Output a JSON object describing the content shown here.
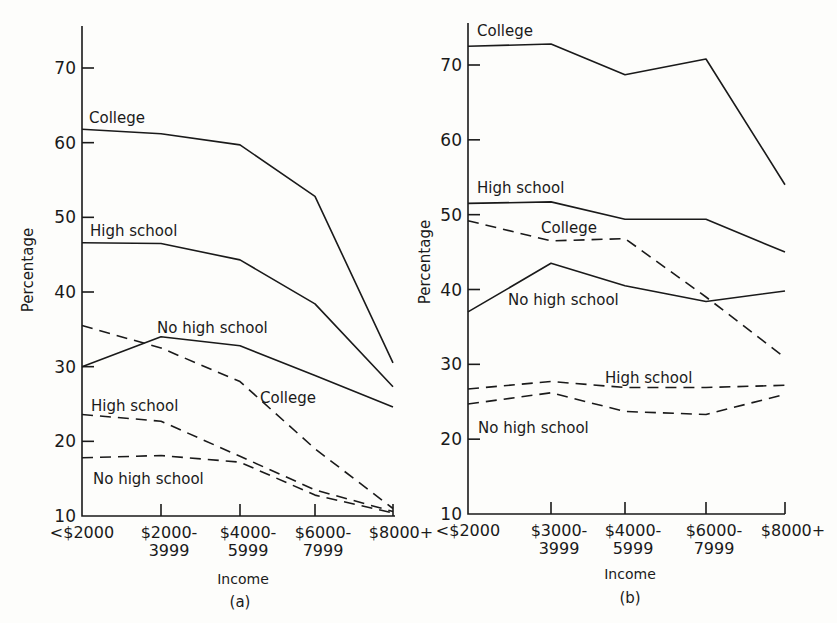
{
  "chart_data": [
    {
      "type": "line",
      "panel": "(a)",
      "title": "",
      "xlabel": "Income",
      "ylabel": "Percentage",
      "ylim": [
        10,
        75
      ],
      "yticks": [
        10,
        20,
        30,
        40,
        50,
        60,
        70
      ],
      "grid": false,
      "legend": "inline labels",
      "categories": [
        "<$2000",
        "$2000-3999",
        "$4000-5999",
        "$6000-7999",
        "$8000+"
      ],
      "category_lines": [
        [
          "<$2000",
          ""
        ],
        [
          "$2000-",
          "3999"
        ],
        [
          "$4000-",
          "5999"
        ],
        [
          "$6000-",
          "7999"
        ],
        [
          "$8000+",
          ""
        ]
      ],
      "series": [
        {
          "name": "College",
          "style": "solid",
          "label": "College",
          "values": [
            61.8,
            61.2,
            59.7,
            52.8,
            30.5
          ]
        },
        {
          "name": "High school",
          "style": "solid",
          "label": "High school",
          "values": [
            46.6,
            46.5,
            44.3,
            38.4,
            27.3
          ]
        },
        {
          "name": "No high school",
          "style": "solid",
          "label": "No high school",
          "values": [
            30.0,
            34.0,
            32.8,
            28.8,
            24.6
          ]
        },
        {
          "name": "College",
          "style": "dashed",
          "label": "College",
          "values": [
            35.5,
            32.5,
            28.0,
            19.0,
            11.0
          ]
        },
        {
          "name": "High school",
          "style": "dashed",
          "label": "High school",
          "values": [
            23.6,
            22.7,
            18.0,
            13.5,
            10.6
          ]
        },
        {
          "name": "No high school",
          "style": "dashed",
          "label": "No high school",
          "values": [
            17.8,
            18.1,
            17.2,
            12.8,
            10.4
          ]
        }
      ]
    },
    {
      "type": "line",
      "panel": "(b)",
      "title": "",
      "xlabel": "Income",
      "ylabel": "Percentage",
      "ylim": [
        10,
        75
      ],
      "yticks": [
        10,
        20,
        30,
        40,
        50,
        60,
        70
      ],
      "grid": false,
      "legend": "inline labels",
      "categories": [
        "<$2000",
        "$3000-3999",
        "$4000-5999",
        "$6000-7999",
        "$8000+"
      ],
      "category_lines": [
        [
          "<$2000",
          ""
        ],
        [
          "$3000-",
          "3999"
        ],
        [
          "$4000-",
          "5999"
        ],
        [
          "$6000-",
          "7999"
        ],
        [
          "$8000+",
          ""
        ]
      ],
      "series": [
        {
          "name": "College",
          "style": "solid",
          "label": "College",
          "values": [
            72.5,
            72.8,
            68.7,
            70.8,
            54.0
          ]
        },
        {
          "name": "High school",
          "style": "solid",
          "label": "High school",
          "values": [
            51.5,
            51.7,
            49.4,
            49.4,
            45.0
          ]
        },
        {
          "name": "No high school",
          "style": "solid",
          "label": "No high school",
          "values": [
            37.0,
            43.5,
            40.5,
            38.4,
            39.8
          ]
        },
        {
          "name": "College",
          "style": "dashed",
          "label": "College",
          "values": [
            49.2,
            46.5,
            46.8,
            39.0,
            30.9
          ]
        },
        {
          "name": "High school",
          "style": "dashed",
          "label": "High school",
          "values": [
            26.7,
            27.7,
            26.9,
            26.9,
            27.2
          ]
        },
        {
          "name": "No high school",
          "style": "dashed",
          "label": "No high school",
          "values": [
            24.7,
            26.2,
            23.7,
            23.3,
            26.0
          ]
        }
      ]
    }
  ],
  "panels": [
    {
      "layout": {
        "x0": 82,
        "xs": [
          82,
          161,
          240,
          315,
          393
        ],
        "y10": 516,
        "y70": 68,
        "ytop": 26,
        "xend": 395
      },
      "label_positions": [
        {
          "text": "College",
          "x": 89,
          "y": 123
        },
        {
          "text": "High school",
          "x": 90,
          "y": 236
        },
        {
          "text": "No high school",
          "x": 157,
          "y": 333
        },
        {
          "text": "College",
          "x": 260,
          "y": 403
        },
        {
          "text": "High school",
          "x": 91,
          "y": 411
        },
        {
          "text": "No high school",
          "x": 93,
          "y": 484
        }
      ],
      "ylabel_pos": {
        "x": 33,
        "y": 270
      },
      "xlabel_pos": {
        "x": 243,
        "y": 584
      },
      "panel_pos": {
        "x": 240,
        "y": 607
      }
    },
    {
      "layout": {
        "x0": 468,
        "xs": [
          468,
          551,
          625,
          706,
          785
        ],
        "y10": 514,
        "y70": 65,
        "ytop": 23,
        "xend": 785
      },
      "label_positions": [
        {
          "text": "College",
          "x": 477,
          "y": 36
        },
        {
          "text": "High school",
          "x": 477,
          "y": 193
        },
        {
          "text": "College",
          "x": 541,
          "y": 233
        },
        {
          "text": "No high school",
          "x": 508,
          "y": 305
        },
        {
          "text": "High school",
          "x": 605,
          "y": 383
        },
        {
          "text": "No high school",
          "x": 478,
          "y": 433
        }
      ],
      "ylabel_pos": {
        "x": 430,
        "y": 262
      },
      "xlabel_pos": {
        "x": 630,
        "y": 579
      },
      "panel_pos": {
        "x": 630,
        "y": 603
      }
    }
  ]
}
